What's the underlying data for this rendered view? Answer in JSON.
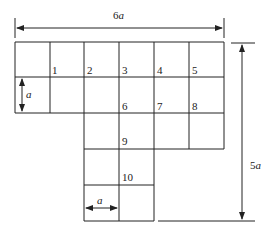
{
  "diagram": {
    "width_label": "6a",
    "height_label": "5a",
    "cell_label_vertical": "a",
    "cell_label_horizontal": "a",
    "grid": {
      "left": 15,
      "top": 42,
      "cell": 35,
      "row_cols": [
        [
          0,
          6
        ],
        [
          0,
          6
        ],
        [
          2,
          6
        ],
        [
          2,
          4
        ],
        [
          2,
          4
        ]
      ]
    },
    "nodes": [
      {
        "label": "1",
        "x": 52,
        "y": 74
      },
      {
        "label": "2",
        "x": 87,
        "y": 74
      },
      {
        "label": "3",
        "x": 122,
        "y": 74
      },
      {
        "label": "4",
        "x": 157,
        "y": 74
      },
      {
        "label": "5",
        "x": 192,
        "y": 74
      },
      {
        "label": "6",
        "x": 122,
        "y": 110
      },
      {
        "label": "7",
        "x": 157,
        "y": 110
      },
      {
        "label": "8",
        "x": 192,
        "y": 110
      },
      {
        "label": "9",
        "x": 122,
        "y": 145
      },
      {
        "label": "10",
        "x": 122,
        "y": 181
      }
    ],
    "colors": {
      "line": "#222222",
      "background": "#ffffff"
    }
  }
}
